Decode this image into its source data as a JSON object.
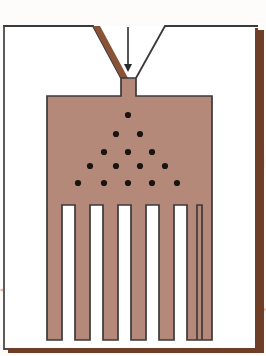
{
  "figure": {
    "width": 266,
    "height": 356
  },
  "colors": {
    "page_background": "#ffffff",
    "plate_background": "#fdfcfa",
    "part_fill": "#b5897a",
    "part_outline": "#3a3a3a",
    "sprue_wall_fill": "#8a5236",
    "mold_wall_line": "#3a3a3a",
    "frame_line": "#4a4a4a",
    "shadow_edge": "#6e3f26",
    "dot_color": "#1a1411",
    "smudge_color": "#e9a98c",
    "smudge_color_faint": "#f2cdb9"
  },
  "frame": {
    "top_border_label": "page-top-edge",
    "right_shadow_label": "page-right-shadow",
    "bottom_shadow_label": "page-bottom-shadow"
  },
  "annotations": {
    "injection_arrow": {
      "name": "injection-direction-arrow",
      "x": 128,
      "y_start": 27,
      "y_end": 72,
      "color": "#2b2b2b"
    }
  },
  "mold": {
    "left_wall_top_y": 26,
    "right_wall_top_y": 26,
    "funnel_left_outer_x": 0,
    "funnel_left_break_x": 93,
    "funnel_right_break_x": 165,
    "funnel_right_outer_x": 266,
    "funnel_bottom_y": 78,
    "sprue_left_x": 121,
    "sprue_right_x": 136,
    "sprue_bottom_y": 96
  },
  "part": {
    "body": {
      "name": "mold-cavity-body",
      "left_x": 47,
      "right_x": 212,
      "top_y": 96,
      "bottom_y": 205
    },
    "fingers": {
      "count": 7,
      "top_y": 205,
      "bottom_y": 340,
      "width": 15,
      "left_positions": [
        47,
        75,
        103,
        131,
        159,
        187,
        197
      ],
      "slot_count": 6
    }
  },
  "sprue_channel": {
    "name": "sprue-channel",
    "label": "gate"
  },
  "dots": {
    "name": "flow-front-particles",
    "radius": 3.1,
    "rows": [
      {
        "row": 1,
        "y": 115,
        "xs": [
          128
        ]
      },
      {
        "row": 2,
        "y": 134,
        "xs": [
          116,
          140
        ]
      },
      {
        "row": 3,
        "y": 152,
        "xs": [
          104,
          128,
          152
        ]
      },
      {
        "row": 4,
        "y": 166,
        "xs": [
          90,
          116,
          140,
          165
        ]
      },
      {
        "row": 5,
        "y": 183,
        "xs": [
          78,
          104,
          128,
          152,
          177
        ]
      }
    ],
    "total": 15
  },
  "smudges": [
    {
      "name": "smudge-left-stripe",
      "x": 0,
      "y": 287,
      "width": 52,
      "height": 6,
      "color": "#e9a98c",
      "opacity": 0.85
    },
    {
      "name": "smudge-right-stripe",
      "x": 205,
      "y": 305,
      "width": 61,
      "height": 9,
      "color": "#edb496",
      "opacity": 0.7
    },
    {
      "name": "smudge-center-wash",
      "x": 55,
      "y": 300,
      "width": 150,
      "height": 22,
      "color": "#f2cdb9",
      "opacity": 0.55
    },
    {
      "name": "smudge-upper-right",
      "x": 215,
      "y": 135,
      "width": 50,
      "height": 55,
      "color": "#f5ddcb",
      "opacity": 0.5
    }
  ]
}
